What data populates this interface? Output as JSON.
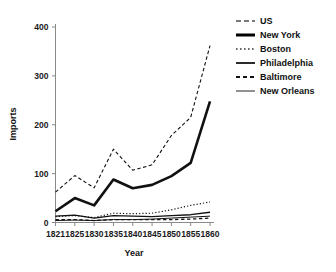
{
  "chart_data": {
    "type": "line",
    "title": "",
    "xlabel": "Year",
    "ylabel": "Imports",
    "x": [
      1821,
      1825,
      1830,
      1835,
      1840,
      1845,
      1850,
      1855,
      1860
    ],
    "xtick_labels": [
      "1821",
      "1825",
      "1830",
      "1835",
      "1840",
      "1845",
      "1850",
      "1855",
      "1860"
    ],
    "ytick_labels": [
      "0",
      "100",
      "200",
      "300",
      "400"
    ],
    "yticks": [
      0,
      100,
      200,
      300,
      400
    ],
    "ylim": [
      0,
      430
    ],
    "xlim": [
      1821,
      1860
    ],
    "grid": false,
    "legend_position": "right",
    "series": [
      {
        "name": "US",
        "style": "dashed",
        "width": 1.1,
        "color": "#4d4d4d",
        "values": [
          62,
          96,
          71,
          150,
          107,
          118,
          178,
          215,
          362
        ]
      },
      {
        "name": "New York",
        "style": "solid",
        "width": 2.6,
        "color": "#000000",
        "values": [
          23,
          50,
          35,
          88,
          70,
          77,
          95,
          122,
          248
        ]
      },
      {
        "name": "Boston",
        "style": "dotted",
        "width": 1.2,
        "color": "#3a3a3a",
        "values": [
          12,
          14,
          10,
          19,
          18,
          19,
          26,
          35,
          42
        ]
      },
      {
        "name": "Philadelphia",
        "style": "solid",
        "width": 1.4,
        "color": "#2b2b2b",
        "values": [
          13,
          15,
          9,
          14,
          13,
          12,
          14,
          16,
          21
        ]
      },
      {
        "name": "Baltimore",
        "style": "dashed-short",
        "width": 1.3,
        "color": "#111111",
        "values": [
          6,
          6,
          4,
          6,
          6,
          6,
          6,
          7,
          9
        ]
      },
      {
        "name": "New Orleans",
        "style": "solid-thin",
        "width": 1.0,
        "color": "#555555",
        "values": [
          4,
          5,
          4,
          6,
          6,
          7,
          9,
          11,
          13
        ]
      }
    ]
  },
  "legend": {
    "items": [
      {
        "label": "US"
      },
      {
        "label": "New York"
      },
      {
        "label": "Boston"
      },
      {
        "label": "Philadelphia"
      },
      {
        "label": "Baltimore"
      },
      {
        "label": "New Orleans"
      }
    ]
  },
  "axes": {
    "x_title": "Year",
    "y_title": "Imports"
  }
}
